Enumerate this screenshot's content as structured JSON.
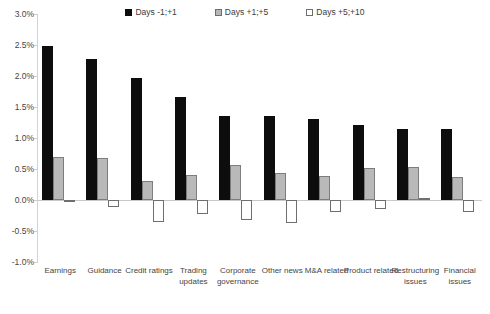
{
  "chart_data": {
    "type": "bar",
    "title": "",
    "subtitle": "",
    "xlabel": "",
    "ylabel": "",
    "ylim": [
      -1.0,
      3.0
    ],
    "ytick_step": 0.5,
    "ytick_labels": [
      "3.0%",
      "2.5%",
      "2.0%",
      "1.5%",
      "1.0%",
      "0.5%",
      "0.0%",
      "-0.5%",
      "-1.0%"
    ],
    "ytick_values": [
      3.0,
      2.5,
      2.0,
      1.5,
      1.0,
      0.5,
      0.0,
      -0.5,
      -1.0
    ],
    "value_unit": "%",
    "grid": false,
    "zero_line": true,
    "legend_position": "top-center",
    "categories": [
      "Earnings",
      "Guidance",
      "Credit ratings",
      "Trading updates",
      "Corporate governance",
      "Other news",
      "M&A related",
      "Product related",
      "Restructuring issues",
      "Financial issues"
    ],
    "series": [
      {
        "name": "Days -1;+1",
        "color": "#0d0d0d",
        "values": [
          2.48,
          2.28,
          1.97,
          1.66,
          1.36,
          1.35,
          1.3,
          1.21,
          1.15,
          1.14
        ]
      },
      {
        "name": "Days +1;+5",
        "color": "#b9b9b9",
        "values": [
          0.69,
          0.68,
          0.3,
          0.4,
          0.57,
          0.43,
          0.39,
          0.52,
          0.54,
          0.37
        ]
      },
      {
        "name": "Days +5;+10",
        "color": "#ffffff",
        "values": [
          -0.01,
          -0.12,
          -0.36,
          -0.22,
          -0.32,
          -0.37,
          -0.2,
          -0.15,
          0.03,
          -0.19
        ]
      }
    ]
  },
  "legend": {
    "items": [
      {
        "label": "Days -1;+1",
        "swatch": "black-square-icon"
      },
      {
        "label": "Days +1;+5",
        "swatch": "gray-square-icon"
      },
      {
        "label": "Days +5;+10",
        "swatch": "white-square-icon"
      }
    ]
  }
}
